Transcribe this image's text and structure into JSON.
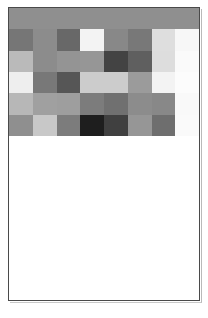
{
  "document": {
    "title": "Grayscale heatmap figure",
    "caption": ""
  },
  "chart_data": {
    "type": "heatmap",
    "title": "",
    "subtitle": "",
    "xlabel": "",
    "ylabel": "",
    "grid": false,
    "legend": "none",
    "colormap": "grayscale",
    "value_range": [
      0,
      255
    ],
    "rows": 6,
    "columns": 8,
    "row_labels": [
      "r1",
      "r2",
      "r3",
      "r4",
      "r5",
      "r6"
    ],
    "column_labels": [
      "c1",
      "c2",
      "c3",
      "c4",
      "c5",
      "c6",
      "c7",
      "c8"
    ],
    "header_row_color": "#8f8f8f",
    "values": [
      [
        143,
        143,
        143,
        143,
        143,
        143,
        143,
        143
      ],
      [
        118,
        140,
        104,
        243,
        136,
        120,
        222,
        247
      ],
      [
        186,
        140,
        148,
        150,
        67,
        95,
        221,
        250
      ],
      [
        238,
        120,
        86,
        204,
        204,
        155,
        243,
        252
      ],
      [
        183,
        160,
        158,
        124,
        112,
        140,
        136,
        249
      ],
      [
        143,
        200,
        124,
        30,
        64,
        150,
        110,
        250
      ]
    ],
    "colors": [
      [
        "#8f8f8f",
        "#8f8f8f",
        "#8f8f8f",
        "#8f8f8f",
        "#8f8f8f",
        "#8f8f8f",
        "#8f8f8f",
        "#8f8f8f"
      ],
      [
        "#767676",
        "#8c8c8c",
        "#686868",
        "#f3f3f3",
        "#888888",
        "#787878",
        "#dedede",
        "#f7f7f7"
      ],
      [
        "#bababa",
        "#8c8c8c",
        "#949494",
        "#969696",
        "#434343",
        "#5f5f5f",
        "#dddddd",
        "#fafafa"
      ],
      [
        "#eeeeee",
        "#787878",
        "#565656",
        "#cccccc",
        "#cccccc",
        "#9b9b9b",
        "#f3f3f3",
        "#fcfcfc"
      ],
      [
        "#b7b7b7",
        "#a0a0a0",
        "#9e9e9e",
        "#7c7c7c",
        "#707070",
        "#8c8c8c",
        "#888888",
        "#f9f9f9"
      ],
      [
        "#8f8f8f",
        "#c8c8c8",
        "#7c7c7c",
        "#1e1e1e",
        "#404040",
        "#969696",
        "#6e6e6e",
        "#fafafa"
      ]
    ]
  }
}
